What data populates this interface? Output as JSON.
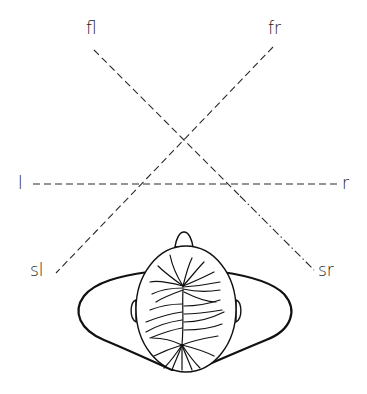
{
  "diagram": {
    "colors": {
      "line": "#2a2a2a",
      "background": "#ffffff"
    },
    "labels": {
      "front_left": "fl",
      "front_right": "fr",
      "left": "l",
      "right": "r",
      "surround_left": "sl",
      "surround_right": "sr"
    },
    "axes": [
      {
        "name": "fl-sr",
        "from": [
          94,
          50
        ],
        "to": [
          314,
          270
        ]
      },
      {
        "name": "fr-sl",
        "from": [
          273,
          47
        ],
        "to": [
          56,
          273
        ]
      },
      {
        "name": "l-r",
        "from": [
          33,
          184
        ],
        "to": [
          340,
          184
        ]
      }
    ]
  }
}
